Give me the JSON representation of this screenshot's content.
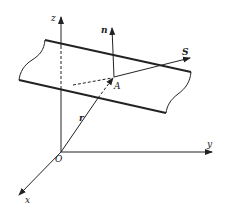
{
  "diagram": {
    "labels": {
      "z_axis": "z",
      "y_axis": "y",
      "x_axis": "x",
      "origin": "O",
      "point": "A",
      "normal": "n",
      "direction": "S",
      "position_vector": "r"
    },
    "colors": {
      "stroke": "#222222",
      "background": "#ffffff"
    }
  }
}
